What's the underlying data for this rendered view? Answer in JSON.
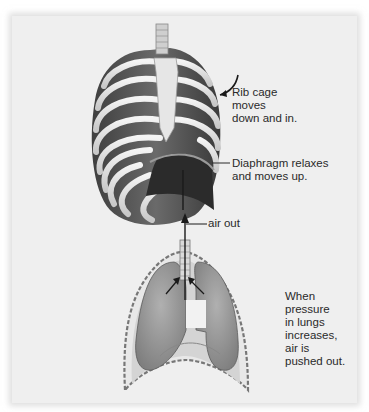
{
  "figure": {
    "labels": {
      "rib_cage": "Rib cage\nmoves\ndown and in.",
      "diaphragm": "Diaphragm relaxes\nand moves up.",
      "air_out": "air out",
      "pressure": "When\npressure\nin lungs\nincreases,\nair is\npushed out."
    },
    "components": [
      "rib-cage",
      "sternum",
      "diaphragm",
      "trachea",
      "left-lung",
      "right-lung",
      "pleural-cavity"
    ],
    "colors": {
      "panel_background": "#efefef",
      "text": "#2a2a2a",
      "bone": "#e4e4e4",
      "muscle": "#555555",
      "lung": "#9a9a9a"
    }
  }
}
